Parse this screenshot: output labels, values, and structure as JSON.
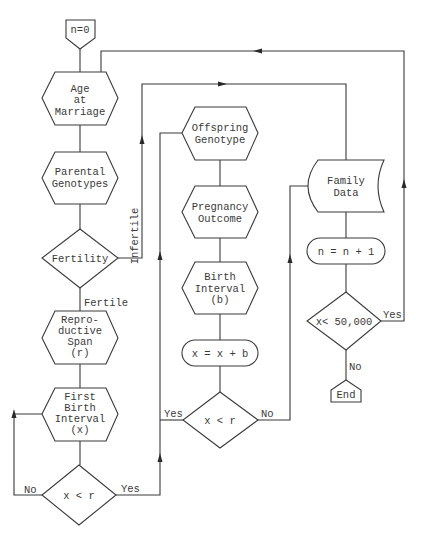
{
  "diagram": {
    "type": "flowchart",
    "colors": {
      "stroke": "#3a3a3a",
      "background": "#ffffff"
    },
    "nodes": {
      "start": {
        "shape": "pentagon-down",
        "lines": [
          "n=0"
        ]
      },
      "age_marriage": {
        "shape": "hexagon",
        "lines": [
          "Age",
          "at",
          "Marriage"
        ]
      },
      "parental_genotypes": {
        "shape": "hexagon",
        "lines": [
          "Parental",
          "Genotypes"
        ]
      },
      "fertility": {
        "shape": "diamond",
        "lines": [
          "Fertility"
        ]
      },
      "reproductive_span": {
        "shape": "hexagon",
        "lines": [
          "Repro-",
          "ductive",
          "Span",
          "(r)"
        ]
      },
      "first_birth_interval": {
        "shape": "hexagon",
        "lines": [
          "First",
          "Birth",
          "Interval",
          "(x)"
        ]
      },
      "decision_left": {
        "shape": "diamond",
        "lines": [
          "x < r"
        ]
      },
      "offspring_genotype": {
        "shape": "hexagon",
        "lines": [
          "Offspring",
          "Genotype"
        ]
      },
      "pregnancy_outcome": {
        "shape": "hexagon",
        "lines": [
          "Pregnancy",
          "Outcome"
        ]
      },
      "birth_interval": {
        "shape": "hexagon",
        "lines": [
          "Birth",
          "Interval",
          "(b)"
        ]
      },
      "increment_x": {
        "shape": "terminal",
        "lines": [
          "x = x + b"
        ]
      },
      "decision_mid": {
        "shape": "diamond",
        "lines": [
          "x < r"
        ]
      },
      "family_data": {
        "shape": "stored-data",
        "lines": [
          "Family",
          "Data"
        ]
      },
      "increment_n": {
        "shape": "terminal",
        "lines": [
          "n = n + 1"
        ]
      },
      "decision_right": {
        "shape": "diamond",
        "lines": [
          "x< 50,000"
        ]
      },
      "end": {
        "shape": "pentagon-up",
        "lines": [
          "End"
        ]
      }
    },
    "edge_labels": {
      "infertile": "Infertile",
      "fertile": "Fertile",
      "left_no": "No",
      "left_yes": "Yes",
      "mid_yes": "Yes",
      "mid_no": "No",
      "right_yes": "Yes",
      "right_no": "No"
    }
  }
}
